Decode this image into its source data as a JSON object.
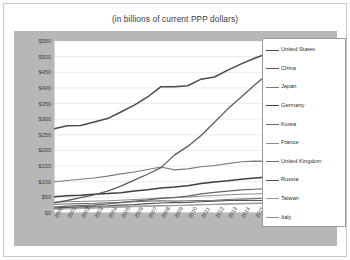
{
  "chart_data": {
    "type": "line",
    "title": "(in billions of current PPP dollars)",
    "xlabel": "",
    "ylabel": "",
    "ylim": [
      0,
      550
    ],
    "ytick_labels": [
      "$0",
      "$50",
      "$100",
      "$150",
      "$200",
      "$250",
      "$300",
      "$350",
      "$400",
      "$450",
      "$500",
      "$550"
    ],
    "ytick_values": [
      0,
      50,
      100,
      150,
      200,
      250,
      300,
      350,
      400,
      450,
      500,
      550
    ],
    "grid": true,
    "legend_position": "right",
    "x": [
      2000,
      2001,
      2002,
      2003,
      2004,
      2005,
      2006,
      2007,
      2008,
      2009,
      2010,
      2011,
      2012,
      2013,
      2014,
      2015,
      2016
    ],
    "categories": [
      "2000",
      "2001",
      "2002",
      "2003",
      "2004",
      "2005",
      "2006",
      "2007",
      "2008",
      "2009",
      "2010",
      "2011",
      "2012",
      "2013",
      "2014",
      "2015",
      "2016"
    ],
    "series": [
      {
        "name": "United States",
        "color": "#4a4a4a",
        "width": 1.5,
        "values": [
          269,
          279,
          280,
          291,
          302,
          323,
          345,
          371,
          404,
          404,
          407,
          428,
          435,
          457,
          477,
          495,
          511
        ]
      },
      {
        "name": "China",
        "color": "#5c5c5c",
        "width": 1.3,
        "values": [
          33,
          40,
          49,
          58,
          70,
          86,
          105,
          124,
          145,
          185,
          213,
          248,
          290,
          333,
          371,
          409,
          445
        ]
      },
      {
        "name": "Japan",
        "color": "#7a7a7a",
        "width": 1.1,
        "values": [
          100,
          104,
          108,
          112,
          118,
          125,
          131,
          139,
          147,
          138,
          141,
          148,
          152,
          158,
          164,
          166,
          165
        ]
      },
      {
        "name": "Germany",
        "color": "#3f3f3f",
        "width": 1.5,
        "values": [
          52,
          55,
          57,
          60,
          62,
          65,
          70,
          74,
          80,
          83,
          87,
          94,
          99,
          103,
          108,
          112,
          115
        ]
      },
      {
        "name": "Korea",
        "color": "#666666",
        "width": 1.2,
        "values": [
          19,
          22,
          24,
          26,
          29,
          33,
          38,
          42,
          47,
          49,
          54,
          61,
          66,
          70,
          74,
          76,
          78
        ]
      },
      {
        "name": "France",
        "color": "#8a8a8a",
        "width": 1.0,
        "values": [
          34,
          36,
          37,
          38,
          39,
          41,
          43,
          45,
          48,
          50,
          51,
          54,
          56,
          58,
          60,
          61,
          62
        ]
      },
      {
        "name": "United Kingdom",
        "color": "#6e6e6e",
        "width": 1.1,
        "values": [
          28,
          29,
          30,
          31,
          33,
          34,
          36,
          38,
          39,
          38,
          39,
          40,
          41,
          43,
          45,
          46,
          47
        ]
      },
      {
        "name": "Russia",
        "color": "#545454",
        "width": 1.2,
        "values": [
          16,
          18,
          20,
          22,
          23,
          25,
          27,
          30,
          32,
          33,
          34,
          36,
          38,
          40,
          41,
          40,
          40
        ]
      },
      {
        "name": "Taiwan",
        "color": "#9c9c9c",
        "width": 0.9,
        "values": [
          12,
          13,
          14,
          15,
          17,
          18,
          20,
          21,
          22,
          23,
          25,
          27,
          28,
          30,
          31,
          32,
          33
        ]
      },
      {
        "name": "Italy",
        "color": "#8f8f8f",
        "width": 1.0,
        "values": [
          15,
          16,
          17,
          18,
          19,
          20,
          22,
          23,
          24,
          24,
          25,
          26,
          27,
          28,
          29,
          30,
          31
        ]
      }
    ]
  },
  "legend": {
    "items": [
      {
        "label": "United States"
      },
      {
        "label": "China"
      },
      {
        "label": "Japan"
      },
      {
        "label": "Germany"
      },
      {
        "label": "Korea"
      },
      {
        "label": "France"
      },
      {
        "label": "United Kingdom"
      },
      {
        "label": "Russia"
      },
      {
        "label": "Taiwan"
      },
      {
        "label": "Italy"
      }
    ]
  }
}
